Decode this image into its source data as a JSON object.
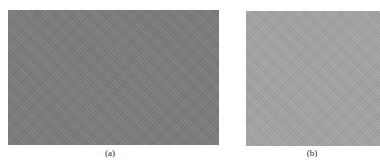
{
  "figure": {
    "panels": [
      {
        "id": "a",
        "label": "(a)",
        "color": "#7a7a7a",
        "description": "uniform dark gray noisy texture"
      },
      {
        "id": "b",
        "label": "(b)",
        "color": "#a3a3a3",
        "description": "uniform light gray noisy texture"
      }
    ]
  }
}
